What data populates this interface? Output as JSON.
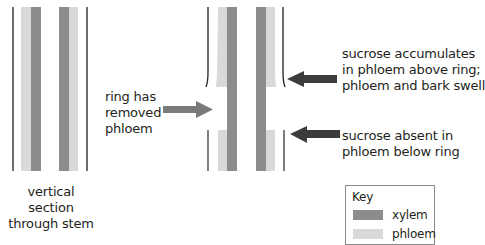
{
  "colors": {
    "xylem": "#8c8c8c",
    "phloem": "#d9d9d9",
    "outline": "#231f20",
    "arrow_light": "#7a7a7a",
    "arrow_dark": "#3c3c3c"
  },
  "left_stem": {
    "caption_line1": "vertical section",
    "caption_line2": "through stem"
  },
  "ring_label": {
    "line1": "ring has",
    "line2": "removed",
    "line3": "phloem"
  },
  "annotations": {
    "above": {
      "line1": "sucrose accumulates",
      "line2": "in phloem above ring;",
      "line3": "phloem and bark swell"
    },
    "below": {
      "line1": "sucrose absent in",
      "line2": "phloem below ring"
    }
  },
  "key": {
    "title": "Key",
    "items": [
      {
        "label": "xylem",
        "color": "#8c8c8c"
      },
      {
        "label": "phloem",
        "color": "#d9d9d9"
      }
    ]
  }
}
